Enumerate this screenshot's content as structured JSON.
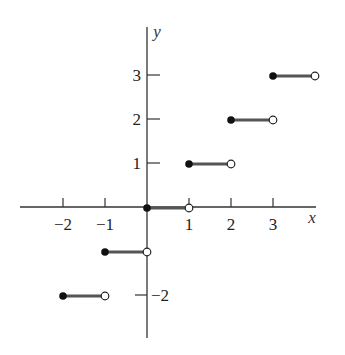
{
  "chart_data": {
    "type": "line",
    "title": "",
    "xlabel": "x",
    "ylabel": "y",
    "xlim": [
      -2.9,
      4.0
    ],
    "ylim": [
      -3.0,
      4.1
    ],
    "grid": false,
    "legend": null,
    "x_ticks": [
      -2,
      -1,
      1,
      2,
      3
    ],
    "x_tick_labels": [
      "−2",
      "−1",
      "1",
      "2",
      "3"
    ],
    "y_ticks": [
      -2,
      1,
      2,
      3
    ],
    "y_tick_labels": [
      "−2",
      "1",
      "2",
      "3"
    ],
    "y_minor_ticks": [
      -2
    ],
    "series": [
      {
        "name": "step",
        "segments": [
          {
            "x_start": -2,
            "x_end": -1,
            "y": -2,
            "start": "closed",
            "end": "open"
          },
          {
            "x_start": -1,
            "x_end": 0,
            "y": -1,
            "start": "closed",
            "end": "open"
          },
          {
            "x_start": 0,
            "x_end": 1,
            "y": 0,
            "start": "closed",
            "end": "open"
          },
          {
            "x_start": 1,
            "x_end": 2,
            "y": 1,
            "start": "closed",
            "end": "open"
          },
          {
            "x_start": 2,
            "x_end": 3,
            "y": 2,
            "start": "closed",
            "end": "open"
          },
          {
            "x_start": 3,
            "x_end": 4,
            "y": 3,
            "start": "closed",
            "end": "open"
          }
        ]
      }
    ],
    "colors": {
      "axis": "#333333",
      "segment": "#555555",
      "closed_dot": "#111111",
      "open_dot_fill": "#ffffff",
      "open_dot_stroke": "#222222"
    }
  },
  "layout": {
    "origin_px": [
      147,
      207
    ],
    "x_unit_px": 42,
    "y_unit_px": 44,
    "x_axis_px": [
      20,
      316
    ],
    "y_axis_px": [
      27,
      338
    ]
  }
}
